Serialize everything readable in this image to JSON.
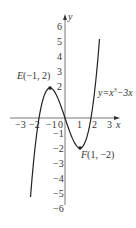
{
  "chart_data": {
    "type": "line",
    "title": "",
    "function": "y=x³−3x",
    "xlabel": "x",
    "ylabel": "y",
    "x_ticks": [
      "−3",
      "−2",
      "−1",
      "0",
      "1",
      "2",
      "3"
    ],
    "y_ticks": [
      "6",
      "5",
      "4",
      "3",
      "2",
      "−1",
      "−2",
      "−3",
      "−4",
      "−5",
      "−6"
    ],
    "xlim": [
      -3.4,
      3.5
    ],
    "ylim": [
      -6.5,
      6.8
    ],
    "grid": false,
    "series": [
      {
        "name": "y=x³−3x",
        "x": [
          -2.3,
          -2.0,
          -1.5,
          -1.0,
          -0.5,
          0,
          0.5,
          1.0,
          1.5,
          2.0,
          2.3
        ],
        "y": [
          -5.27,
          -2.0,
          1.13,
          2.0,
          1.38,
          0,
          -1.38,
          -2.0,
          -1.13,
          2.0,
          5.27
        ]
      }
    ],
    "annotations": [
      {
        "label": "E(−1, 2)",
        "x": -1,
        "y": 2,
        "type": "local maximum"
      },
      {
        "label": "F(1, −2)",
        "x": 1,
        "y": -2,
        "type": "local minimum"
      },
      {
        "label": "y=x³−3x",
        "type": "curve label"
      }
    ]
  },
  "labels": {
    "point_e": "E(−1, 2)",
    "point_f": "F(1, −2)",
    "curve": "y=x",
    "curve_exp": "3",
    "curve_tail": "−3x",
    "x_axis": "x",
    "y_axis": "y",
    "origin": "O"
  }
}
